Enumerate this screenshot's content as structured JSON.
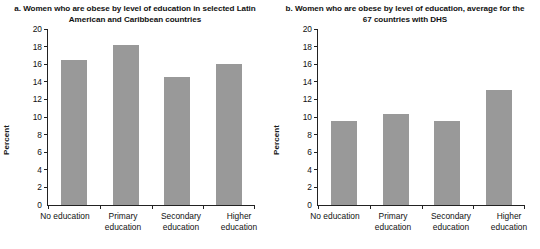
{
  "chart_data": [
    {
      "type": "bar",
      "panel": "a",
      "title": "a. Women who are obese by level of education in selected Latin American and Caribbean countries",
      "title_line1": "a. Women who are obese by level of education in",
      "title_line2": "selected Latin American and Caribbean countries",
      "categories": [
        "No education",
        "Primary education",
        "Secondary education",
        "Higher education"
      ],
      "category_lines": [
        {
          "line1": "No education",
          "line2": ""
        },
        {
          "line1": "Primary",
          "line2": "education"
        },
        {
          "line1": "Secondary",
          "line2": "education"
        },
        {
          "line1": "Higher",
          "line2": "education"
        }
      ],
      "values": [
        16.5,
        18.2,
        14.6,
        16.0
      ],
      "xlabel": "",
      "ylabel": "Percent",
      "ylim": [
        0,
        20
      ],
      "yticks": [
        0,
        2,
        4,
        6,
        8,
        10,
        12,
        14,
        16,
        18,
        20
      ],
      "grid": false,
      "legend": "none",
      "bar_color": "#999999"
    },
    {
      "type": "bar",
      "panel": "b",
      "title": "b. Women who are obese by level of education, average for the 67 countries with DHS",
      "title_line1": "b. Women who are obese by level of education,",
      "title_line2": "average for the 67 countries with DHS",
      "categories": [
        "No education",
        "Primary education",
        "Secondary education",
        "Higher education"
      ],
      "category_lines": [
        {
          "line1": "No education",
          "line2": ""
        },
        {
          "line1": "Primary",
          "line2": "education"
        },
        {
          "line1": "Secondary",
          "line2": "education"
        },
        {
          "line1": "Higher",
          "line2": "education"
        }
      ],
      "values": [
        9.6,
        10.3,
        9.5,
        13.1
      ],
      "xlabel": "",
      "ylabel": "Percent",
      "ylim": [
        0,
        20
      ],
      "yticks": [
        0,
        2,
        4,
        6,
        8,
        10,
        12,
        14,
        16,
        18,
        20
      ],
      "grid": false,
      "legend": "none",
      "bar_color": "#999999"
    }
  ]
}
